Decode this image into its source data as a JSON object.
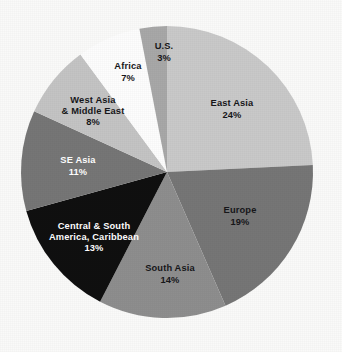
{
  "figure": {
    "background_color": "#fafaf9",
    "width": 342,
    "height": 352
  },
  "chart_data": {
    "type": "pie",
    "title": "",
    "subtitle": "",
    "xlabel": "",
    "ylabel": "",
    "grid": false,
    "legend_position": "none",
    "labels_on_slices": true,
    "units": "percent",
    "start_angle_deg": 0,
    "direction": "clockwise",
    "center": {
      "x": 167,
      "y": 172
    },
    "radius": 146,
    "categories": [
      "East Asia",
      "Europe",
      "South Asia",
      "Central & South America, Caribbean",
      "SE Asia",
      "West Asia & Middle East",
      "Africa",
      "U.S."
    ],
    "values": [
      24,
      19,
      14,
      13,
      11,
      8,
      7,
      3
    ],
    "total": 99,
    "slices": [
      {
        "name": "East Asia",
        "value": 24,
        "value_text": "24%",
        "color": "#c9c9c9",
        "text_color": "#17171a",
        "label_lines": [
          "East Asia",
          "24%"
        ],
        "label_x": 232,
        "label_y": 110
      },
      {
        "name": "Europe",
        "value": 19,
        "value_text": "19%",
        "color": "#767676",
        "text_color": "#17171a",
        "label_lines": [
          "Europe",
          "19%"
        ],
        "label_x": 240,
        "label_y": 217
      },
      {
        "name": "South Asia",
        "value": 14,
        "value_text": "14%",
        "color": "#8e8e8e",
        "text_color": "#17171a",
        "label_lines": [
          "South Asia",
          "14%"
        ],
        "label_x": 170,
        "label_y": 275
      },
      {
        "name": "Central & South America, Caribbean",
        "value": 13,
        "value_text": "13%",
        "color": "#101010",
        "text_color": "#ffffff",
        "label_lines": [
          "Central & South",
          "America, Caribbean",
          "13%"
        ],
        "label_x": 94,
        "label_y": 238
      },
      {
        "name": "SE Asia",
        "value": 11,
        "value_text": "11%",
        "color": "#767676",
        "text_color": "#ffffff",
        "label_lines": [
          "SE Asia",
          "11%"
        ],
        "label_x": 78,
        "label_y": 167
      },
      {
        "name": "West Asia & Middle East",
        "value": 8,
        "value_text": "8%",
        "color": "#c4c4c4",
        "text_color": "#17171a",
        "label_lines": [
          "West Asia",
          "& Middle East",
          "8%"
        ],
        "label_x": 93,
        "label_y": 112
      },
      {
        "name": "Africa",
        "value": 7,
        "value_text": "7%",
        "color": "#fdfdfd",
        "text_color": "#17171a",
        "label_lines": [
          "Africa",
          "7%"
        ],
        "label_x": 128,
        "label_y": 73
      },
      {
        "name": "U.S.",
        "value": 3,
        "value_text": "3%",
        "color": "#a8a8a8",
        "text_color": "#17171a",
        "label_lines": [
          "U.S.",
          "3%"
        ],
        "label_x": 164,
        "label_y": 53
      }
    ]
  }
}
